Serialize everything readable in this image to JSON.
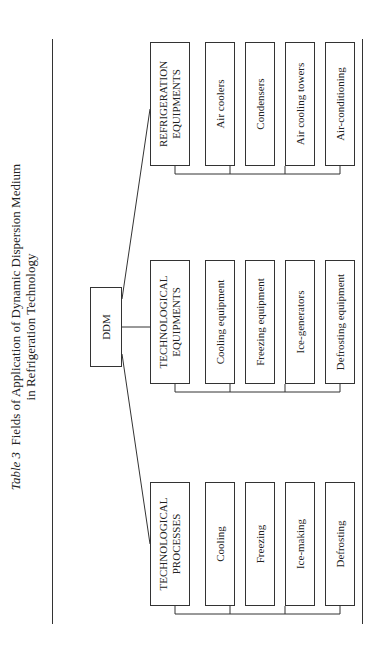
{
  "title": {
    "label": "Table 3",
    "text_line1": "Fields of Application of Dynamic Dispersion Medium",
    "text_line2": "in Refrigeration Technology"
  },
  "root": "DDM",
  "columns": [
    {
      "header": "TECHNOLOGICAL PROCESSES",
      "items": [
        "Cooling",
        "Freezing",
        "Ice-making",
        "Defrosting"
      ]
    },
    {
      "header": "TECHNOLOGICAL EQUIPMENTS",
      "items": [
        "Cooling equipment",
        "Freezing equipment",
        "Ice-generators",
        "Defrosting equipment"
      ]
    },
    {
      "header": "REFRIGERATION EQUIPMENTS",
      "items": [
        "Air coolers",
        "Condensers",
        "Air cooling towers",
        "Air-conditioning"
      ]
    }
  ]
}
